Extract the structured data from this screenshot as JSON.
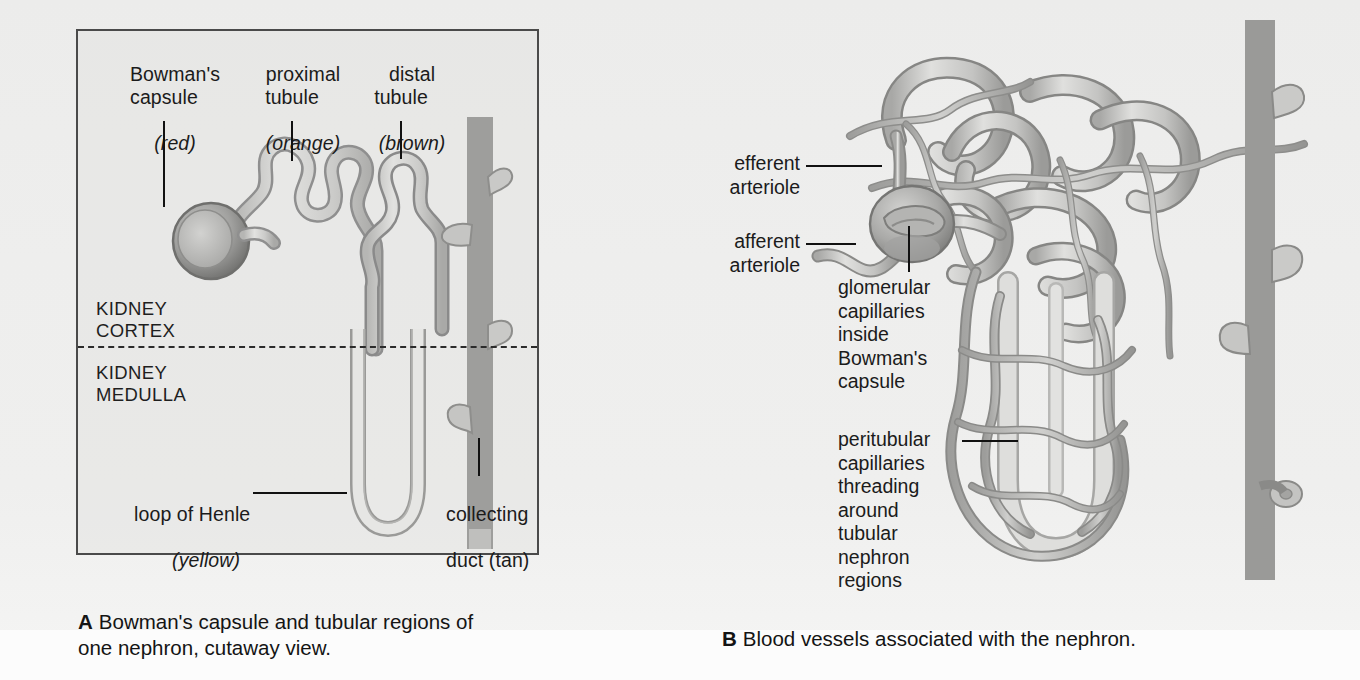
{
  "figure": {
    "panel_a": {
      "labels": {
        "bowmans_capsule": "Bowman's\ncapsule",
        "bowmans_capsule_color": "(red)",
        "proximal_tubule": "proximal\ntubule",
        "proximal_tubule_color": "(orange)",
        "distal_tubule": "distal\ntubule",
        "distal_tubule_color": "(brown)",
        "loop_of_henle": "loop of Henle",
        "loop_of_henle_color": "(yellow)",
        "collecting_duct": "collecting",
        "collecting_duct_color": "duct (tan)",
        "kidney_cortex": "KIDNEY\nCORTEX",
        "kidney_medulla": "KIDNEY\nMEDULLA"
      },
      "caption_letter": "A",
      "caption_text": "Bowman's capsule and tubular regions of\none nephron, cutaway view."
    },
    "panel_b": {
      "labels": {
        "efferent_arteriole": "efferent\narteriole",
        "afferent_arteriole": "afferent\narteriole",
        "glomerular_capillaries": "glomerular\ncapillaries\ninside\nBowman's\ncapsule",
        "peritubular_capillaries": "peritubular\ncapillaries\nthreading\naround\ntubular\nnephron\nregions"
      },
      "caption_letter": "B",
      "caption_text": "Blood vessels associated with the nephron."
    },
    "colors": {
      "tubule_stroke": "#8f8f8f",
      "tubule_fill": "#d5d5d3",
      "vessel_stroke": "#8a8a8a",
      "vessel_fill": "#cfcfcd",
      "capsule_dark": "#7e7e7e",
      "panel_border": "#4a4a4a",
      "text": "#1b1b1b",
      "divider": "#2b2b2b",
      "background": "#eeeeed"
    }
  }
}
